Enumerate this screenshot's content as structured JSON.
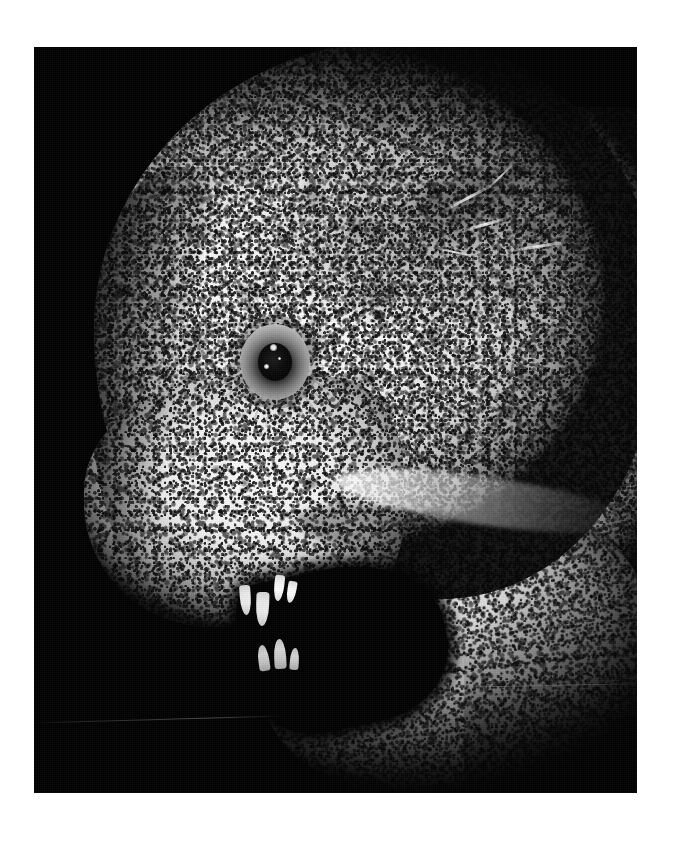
{
  "page": {
    "background_color": "#ffffff",
    "width": 674,
    "height": 843,
    "caption": ""
  },
  "photo": {
    "title": "Wolf eel head in profile",
    "description": "High-contrast black-and-white photograph of the head of a wolf eel (Anarrhichthys ocellatus) facing left against a pure black background, mouth open showing conical teeth.",
    "orientation": "portrait",
    "frame": {
      "x": 34,
      "y": 47,
      "width": 603,
      "height": 746
    },
    "background_color": "#000000",
    "skin_color": "#f4f4f4",
    "shadow_color": "#0d0d0d",
    "accent_color": "#000000"
  },
  "subject": {
    "name": "wolf-eel-head",
    "facing": "left",
    "parts": [
      {
        "id": "cranial-dome",
        "label": "Cranial dome"
      },
      {
        "id": "snout",
        "label": "Snout"
      },
      {
        "id": "eye",
        "label": "Eye"
      },
      {
        "id": "upper-jaw",
        "label": "Upper jaw"
      },
      {
        "id": "lower-jaw",
        "label": "Lower jaw"
      },
      {
        "id": "mouth-cavity",
        "label": "Open mouth"
      },
      {
        "id": "nape",
        "label": "Nape / trunk"
      },
      {
        "id": "skin-texture",
        "label": "Mottled speckled skin"
      }
    ]
  },
  "eye": {
    "label": "Eye",
    "center_x": 241,
    "center_y": 315,
    "iris_diameter": 70,
    "pupil_diameter": 34,
    "iris_color": "#8e8e8e",
    "pupil_color": "#000000",
    "highlights": [
      {
        "x": 30,
        "y": 20,
        "size": 7
      },
      {
        "x": 24,
        "y": 40,
        "size": 5
      },
      {
        "x": 38,
        "y": 33,
        "size": 3
      }
    ]
  },
  "teeth": {
    "label": "Conical teeth",
    "upper": [
      {
        "x": 206,
        "y": 538,
        "w": 11,
        "h": 30,
        "rot": -4
      },
      {
        "x": 222,
        "y": 545,
        "w": 13,
        "h": 34,
        "rot": 2
      },
      {
        "x": 240,
        "y": 528,
        "w": 10,
        "h": 26,
        "rot": 6
      },
      {
        "x": 253,
        "y": 534,
        "w": 9,
        "h": 22,
        "rot": 10
      }
    ],
    "lower": [
      {
        "x": 224,
        "y": 598,
        "w": 11,
        "h": 26,
        "rot": -8
      },
      {
        "x": 240,
        "y": 592,
        "w": 12,
        "h": 30,
        "rot": -3
      },
      {
        "x": 256,
        "y": 601,
        "w": 9,
        "h": 22,
        "rot": 4
      }
    ]
  },
  "markings": {
    "pores": [
      {
        "x": 150,
        "y": 400,
        "w": 16,
        "h": 11
      },
      {
        "x": 176,
        "y": 418,
        "w": 13,
        "h": 9
      },
      {
        "x": 205,
        "y": 432,
        "w": 11,
        "h": 8
      },
      {
        "x": 268,
        "y": 430,
        "w": 18,
        "h": 12
      },
      {
        "x": 300,
        "y": 452,
        "w": 14,
        "h": 10
      },
      {
        "x": 120,
        "y": 352,
        "w": 12,
        "h": 9
      }
    ],
    "scratches": [
      {
        "x": 400,
        "y": 150,
        "w": 66,
        "h": 3,
        "rot": -28
      },
      {
        "x": 424,
        "y": 176,
        "w": 54,
        "h": 3,
        "rot": -16
      },
      {
        "x": 446,
        "y": 128,
        "w": 42,
        "h": 2,
        "rot": -44
      },
      {
        "x": 468,
        "y": 198,
        "w": 72,
        "h": 3,
        "rot": -9
      },
      {
        "x": 396,
        "y": 204,
        "w": 48,
        "h": 2,
        "rot": 12
      }
    ],
    "baselines": [
      {
        "x": 0,
        "y": 672,
        "w": 250,
        "rot": -1.6
      },
      {
        "x": 418,
        "y": 638,
        "w": 190,
        "rot": -1.1
      }
    ]
  },
  "tonal_range": {
    "black_point": "#000000",
    "shadow": "#1a1a1a",
    "midtone": "#8a8a8a",
    "highlight": "#f6f6f6",
    "white_point": "#ffffff"
  }
}
